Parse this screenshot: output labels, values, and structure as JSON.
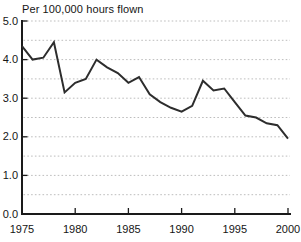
{
  "chart_data": {
    "type": "line",
    "title": "Per 100,000 hours flown",
    "x": [
      1975,
      1976,
      1977,
      1978,
      1979,
      1980,
      1981,
      1982,
      1983,
      1984,
      1985,
      1986,
      1987,
      1988,
      1989,
      1990,
      1991,
      1992,
      1993,
      1994,
      1995,
      1996,
      1997,
      1998,
      1999,
      2000
    ],
    "values": [
      4.35,
      4.0,
      4.05,
      4.45,
      3.15,
      3.4,
      3.5,
      4.0,
      3.8,
      3.65,
      3.4,
      3.55,
      3.1,
      2.9,
      2.75,
      2.65,
      2.8,
      3.45,
      3.2,
      3.25,
      2.9,
      2.55,
      2.5,
      2.35,
      2.3,
      1.95
    ],
    "xlabel": "",
    "ylabel": "",
    "xlim": [
      1975,
      2000
    ],
    "ylim": [
      0.0,
      5.0
    ],
    "x_ticks": [
      1975,
      1980,
      1985,
      1990,
      1995,
      2000
    ],
    "x_tick_labels": [
      "1975",
      "1980",
      "1985",
      "1990",
      "1995",
      "2000"
    ],
    "y_ticks": [
      0,
      1,
      2,
      3,
      4,
      5
    ],
    "y_tick_labels": [
      "0.0",
      "1.0",
      "2.0",
      "3.0",
      "4.0",
      "5.0"
    ],
    "gridline_interval": 0.5,
    "grid": "horizontal-dotted",
    "legend": "none",
    "colors": {
      "line": "#2d2d2d",
      "axis": "#1a1a1a",
      "grid": "#bdbdbd",
      "text": "#151515",
      "background": "#ffffff"
    }
  }
}
